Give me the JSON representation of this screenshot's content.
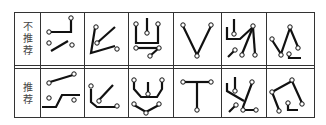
{
  "table": {
    "rows": [
      {
        "label_chars": [
          "不",
          "推",
          "荐"
        ],
        "label": "不推荐"
      },
      {
        "label_chars": [
          "推",
          "荐"
        ],
        "label": "推荐"
      }
    ],
    "columns": 6,
    "stroke_color": "#111111",
    "border_color": "#333333"
  }
}
